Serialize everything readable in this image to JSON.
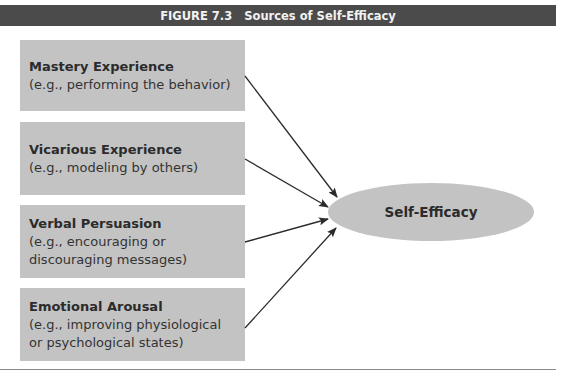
{
  "figure": {
    "number": "FIGURE 7.3",
    "title": "Sources of Self-Efficacy"
  },
  "sources": [
    {
      "title": "Mastery Experience",
      "desc_lines": [
        "(e.g., performing the behavior)"
      ]
    },
    {
      "title": "Vicarious Experience",
      "desc_lines": [
        "(e.g., modeling by others)"
      ]
    },
    {
      "title": "Verbal Persuasion",
      "desc_lines": [
        "(e.g., encouraging or",
        "discouraging messages)"
      ]
    },
    {
      "title": "Emotional Arousal",
      "desc_lines": [
        "(e.g., improving physiological",
        "or psychological states)"
      ]
    }
  ],
  "target": {
    "label": "Self-Efficacy"
  },
  "colors": {
    "header": "#4b4b4b",
    "box": "#c3c3c3",
    "arrow": "#2b2b2b"
  }
}
